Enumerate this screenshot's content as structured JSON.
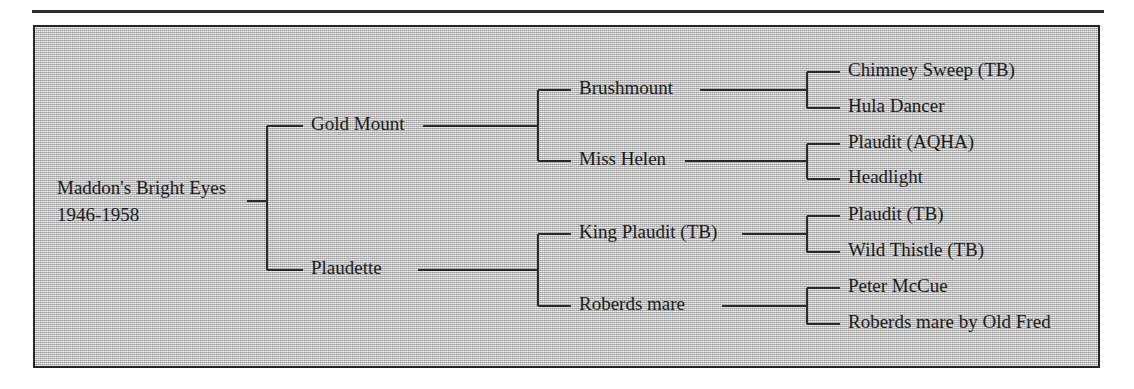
{
  "figure": {
    "type": "pedigree-tree",
    "orientation": "left-to-right",
    "generations": 4,
    "background_color": "#b9b9b9",
    "border_color": "#252525",
    "line_color": "#2a2a2a",
    "text_color": "#1b1b1b"
  },
  "root": {
    "name": "Maddon's Bright Eyes",
    "years": "1946-1958"
  },
  "generation2": [
    {
      "name": "Gold Mount"
    },
    {
      "name": "Plaudette"
    }
  ],
  "generation3": [
    {
      "name": "Brushmount"
    },
    {
      "name": "Miss Helen"
    },
    {
      "name": "King Plaudit (TB)"
    },
    {
      "name": "Roberds mare"
    }
  ],
  "generation4": [
    {
      "name": "Chimney Sweep (TB)"
    },
    {
      "name": "Hula Dancer"
    },
    {
      "name": "Plaudit (AQHA)"
    },
    {
      "name": "Headlight"
    },
    {
      "name": "Plaudit (TB)"
    },
    {
      "name": "Wild Thistle (TB)"
    },
    {
      "name": "Peter McCue"
    },
    {
      "name": "Roberds mare by Old Fred"
    }
  ]
}
